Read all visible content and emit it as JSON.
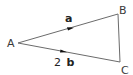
{
  "diagram": {
    "type": "vector-triangle",
    "vertices": [
      {
        "label": "A",
        "x": 18,
        "y": 43
      },
      {
        "label": "B",
        "x": 118,
        "y": 14
      },
      {
        "label": "C",
        "x": 120,
        "y": 62
      }
    ],
    "edges": [
      {
        "from": "A",
        "to": "B",
        "vector_label": "a",
        "arrow": true
      },
      {
        "from": "A",
        "to": "C",
        "vector_label_coef": "2",
        "vector_label_var": "b",
        "arrow": true
      },
      {
        "from": "B",
        "to": "C",
        "arrow": false
      }
    ],
    "labels": {
      "A": "A",
      "B": "B",
      "C": "C",
      "ab": "a",
      "ac_coef": "2",
      "ac_var": "b"
    },
    "colors": {
      "line": "#6b6b6b",
      "text": "#3a3a3a",
      "arrow": "#111111"
    }
  }
}
